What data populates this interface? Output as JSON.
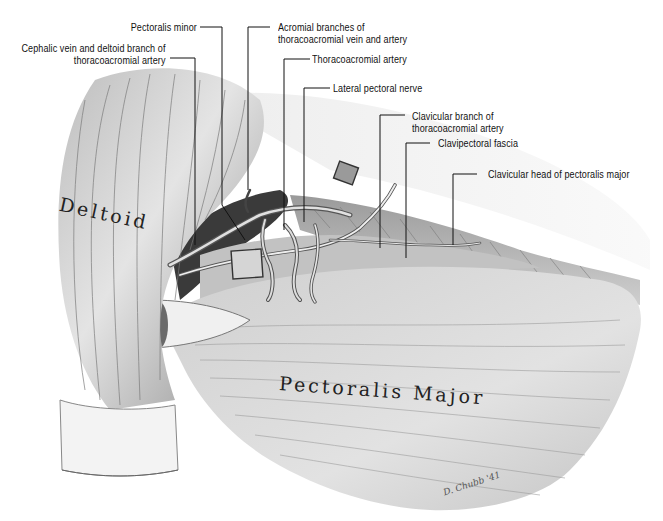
{
  "figure": {
    "type": "anatomical illustration"
  },
  "labels": [
    {
      "id": "pectoralis-minor",
      "lines": [
        "Pectoralis minor"
      ]
    },
    {
      "id": "cephalic-vein",
      "lines": [
        "Cephalic vein and deltoid branch of",
        "thoracoacromial artery"
      ]
    },
    {
      "id": "acromial-branches",
      "lines": [
        "Acromial branches of",
        "thoracoacromial vein and artery"
      ]
    },
    {
      "id": "thoracoacromial-artery",
      "lines": [
        "Thoracoacromial artery"
      ]
    },
    {
      "id": "lateral-pectoral-nerve",
      "lines": [
        "Lateral pectoral nerve"
      ]
    },
    {
      "id": "clavicular-branch",
      "lines": [
        "Clavicular branch of",
        "thoracoacromial artery"
      ]
    },
    {
      "id": "clavipectoral-fascia",
      "lines": [
        "Clavipectoral fascia"
      ]
    },
    {
      "id": "clavicular-head",
      "lines": [
        "Clavicular head of pectoralis major"
      ]
    }
  ],
  "muscle_names": {
    "deltoid": "Deltoid",
    "pectoralis_major": "Pectoralis Major"
  },
  "signature": "D. Chubb '41",
  "colors": {
    "background": "#ffffff",
    "ink": "#111111",
    "muscle_light": "#d9d9d9",
    "muscle_dark": "#6a6a6a"
  }
}
